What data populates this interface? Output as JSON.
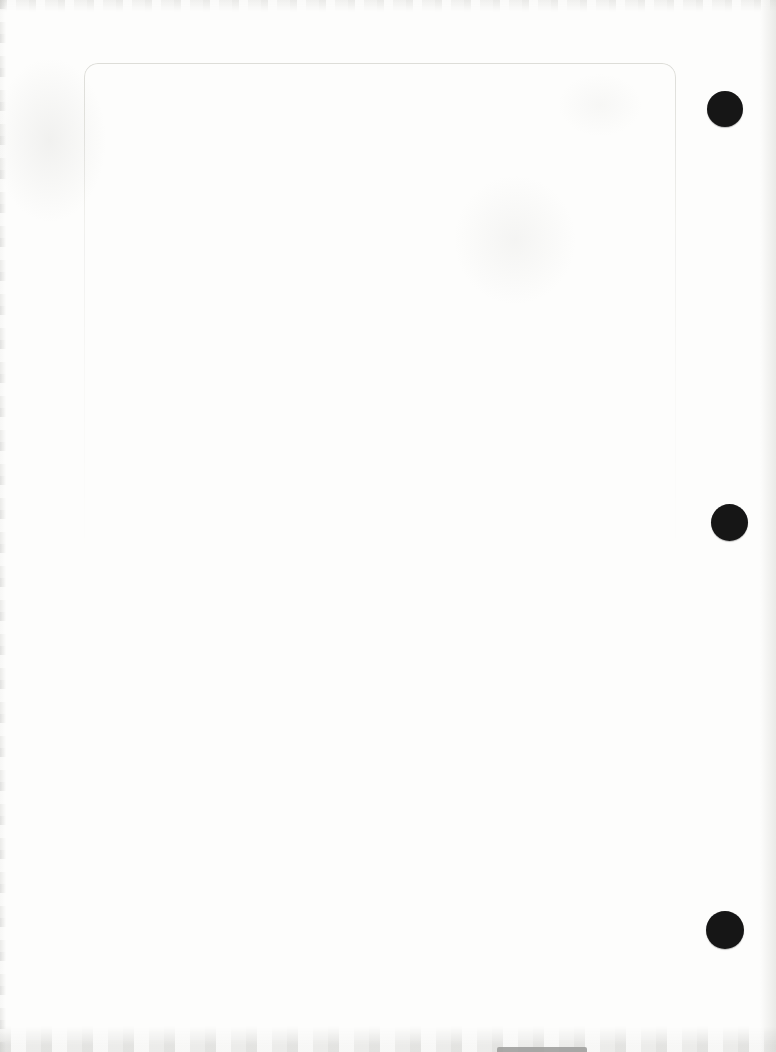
{
  "document": {
    "description": "Blank scanned page with three black binder punch holes along the right edge",
    "paper_color": "#fdfdfc",
    "sheet_outline": {
      "color": "#d9d9d4",
      "left_px": 84,
      "top_px": 63,
      "width_px": 590,
      "corner_radius_px": 14
    },
    "punch_holes": {
      "color": "#161616",
      "items": [
        {
          "name": "punch-hole-top",
          "cx": 725,
          "cy": 109,
          "diameter": 36
        },
        {
          "name": "punch-hole-middle",
          "cx": 729,
          "cy": 522,
          "diameter": 37
        },
        {
          "name": "punch-hole-bottom",
          "cx": 725,
          "cy": 930,
          "diameter": 38
        }
      ]
    },
    "bottom_bar_color": "#a0a09e"
  }
}
